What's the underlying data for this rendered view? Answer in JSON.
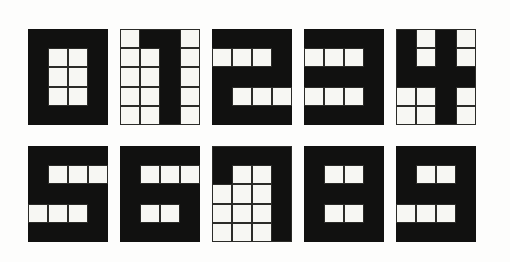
{
  "sheet": {
    "title": "Block digit glyph sheet",
    "description": "Ten hand-drawn pixel-grid numerals 0 through 9 arranged in two rows of five on a white page",
    "background_color": "#fdfdfc",
    "ink_color": "#111110",
    "paper_cell_color": "#f7f7f3",
    "grid_line_color": "#2b2b28",
    "grid_columns": 4,
    "grid_rows": 5,
    "rows": [
      {
        "name": "top-row",
        "glyph_ids": [
          "0",
          "1",
          "2",
          "3",
          "4"
        ]
      },
      {
        "name": "bottom-row",
        "glyph_ids": [
          "5",
          "6",
          "7",
          "8",
          "9"
        ]
      }
    ]
  },
  "glyphs": [
    {
      "id": "0",
      "label": "0",
      "name": "digit-zero",
      "framed": false,
      "matrix": [
        [
          1,
          1,
          1,
          1
        ],
        [
          1,
          0,
          0,
          1
        ],
        [
          1,
          0,
          0,
          1
        ],
        [
          1,
          0,
          0,
          1
        ],
        [
          1,
          1,
          1,
          1
        ]
      ]
    },
    {
      "id": "1",
      "label": "1",
      "name": "digit-one",
      "framed": true,
      "matrix": [
        [
          0,
          1,
          1,
          0
        ],
        [
          0,
          0,
          1,
          0
        ],
        [
          0,
          0,
          1,
          0
        ],
        [
          0,
          0,
          1,
          0
        ],
        [
          0,
          0,
          1,
          0
        ]
      ]
    },
    {
      "id": "2",
      "label": "2",
      "name": "digit-two",
      "framed": false,
      "matrix": [
        [
          1,
          1,
          1,
          1
        ],
        [
          0,
          0,
          0,
          1
        ],
        [
          1,
          1,
          1,
          1
        ],
        [
          1,
          0,
          0,
          0
        ],
        [
          1,
          1,
          1,
          1
        ]
      ]
    },
    {
      "id": "3",
      "label": "3",
      "name": "digit-three",
      "framed": false,
      "matrix": [
        [
          1,
          1,
          1,
          1
        ],
        [
          0,
          0,
          0,
          1
        ],
        [
          1,
          1,
          1,
          1
        ],
        [
          0,
          0,
          0,
          1
        ],
        [
          1,
          1,
          1,
          1
        ]
      ]
    },
    {
      "id": "4",
      "label": "4",
      "name": "digit-four",
      "framed": true,
      "matrix": [
        [
          1,
          0,
          1,
          0
        ],
        [
          1,
          0,
          1,
          0
        ],
        [
          1,
          1,
          1,
          1
        ],
        [
          0,
          0,
          1,
          0
        ],
        [
          0,
          0,
          1,
          0
        ]
      ]
    },
    {
      "id": "5",
      "label": "5",
      "name": "digit-five",
      "framed": false,
      "matrix": [
        [
          1,
          1,
          1,
          1
        ],
        [
          1,
          0,
          0,
          0
        ],
        [
          1,
          1,
          1,
          1
        ],
        [
          0,
          0,
          0,
          1
        ],
        [
          1,
          1,
          1,
          1
        ]
      ]
    },
    {
      "id": "6",
      "label": "6",
      "name": "digit-six",
      "framed": false,
      "matrix": [
        [
          1,
          1,
          1,
          1
        ],
        [
          1,
          0,
          0,
          0
        ],
        [
          1,
          1,
          1,
          1
        ],
        [
          1,
          0,
          0,
          1
        ],
        [
          1,
          1,
          1,
          1
        ]
      ]
    },
    {
      "id": "7",
      "label": "7",
      "name": "digit-seven",
      "framed": true,
      "matrix": [
        [
          1,
          1,
          1,
          1
        ],
        [
          1,
          0,
          0,
          1
        ],
        [
          0,
          0,
          0,
          1
        ],
        [
          0,
          0,
          0,
          1
        ],
        [
          0,
          0,
          0,
          1
        ]
      ]
    },
    {
      "id": "8",
      "label": "8",
      "name": "digit-eight",
      "framed": false,
      "matrix": [
        [
          1,
          1,
          1,
          1
        ],
        [
          1,
          0,
          0,
          1
        ],
        [
          1,
          1,
          1,
          1
        ],
        [
          1,
          0,
          0,
          1
        ],
        [
          1,
          1,
          1,
          1
        ]
      ]
    },
    {
      "id": "9",
      "label": "9",
      "name": "digit-nine",
      "framed": false,
      "matrix": [
        [
          1,
          1,
          1,
          1
        ],
        [
          1,
          0,
          0,
          1
        ],
        [
          1,
          1,
          1,
          1
        ],
        [
          0,
          0,
          0,
          1
        ],
        [
          1,
          1,
          1,
          1
        ]
      ]
    }
  ]
}
